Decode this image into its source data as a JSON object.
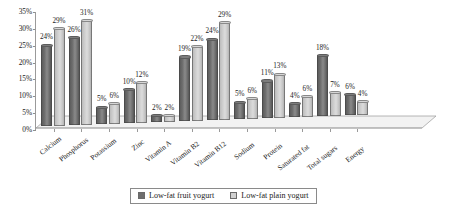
{
  "chart_data": {
    "type": "bar",
    "title": "",
    "subtitle": "",
    "xlabel": "",
    "ylabel": "",
    "ylim": [
      0,
      35
    ],
    "ytick_labels": [
      "0%",
      "5%",
      "10%",
      "15%",
      "20%",
      "25%",
      "30%",
      "35%"
    ],
    "ytick_values": [
      0,
      5,
      10,
      15,
      20,
      25,
      30,
      35
    ],
    "grid": false,
    "legend_position": "bottom",
    "style": "3d-clustered-column",
    "categories": [
      "Calcium",
      "Phosphorus",
      "Potassium",
      "Zinc",
      "Vitamin A",
      "Vitamin B2",
      "Vitamin B12",
      "Sodium",
      "Protein",
      "Saturated fat",
      "Total sugars",
      "Energy"
    ],
    "series": [
      {
        "name": "Low-fat fruit yogurt",
        "color": "#6e6e6e",
        "values": [
          24,
          26,
          5,
          10,
          2,
          19,
          24,
          5,
          11,
          4,
          18,
          6
        ],
        "labels": [
          "24%",
          "26%",
          "5%",
          "10%",
          "2%",
          "19%",
          "24%",
          "5%",
          "11%",
          "4%",
          "18%",
          "6%"
        ]
      },
      {
        "name": "Low-fat plain yogurt",
        "color": "#d0d0d0",
        "values": [
          29,
          31,
          6,
          12,
          2,
          22,
          29,
          6,
          13,
          6,
          7,
          4
        ],
        "labels": [
          "29%",
          "31%",
          "6%",
          "12%",
          "2%",
          "22%",
          "29%",
          "6%",
          "13%",
          "6%",
          "7%",
          "4%"
        ]
      }
    ]
  },
  "legend": {
    "items": [
      {
        "label": "Low-fat fruit yogurt",
        "swatch": "dark"
      },
      {
        "label": "Low-fat plain yogurt",
        "swatch": "light"
      }
    ]
  }
}
